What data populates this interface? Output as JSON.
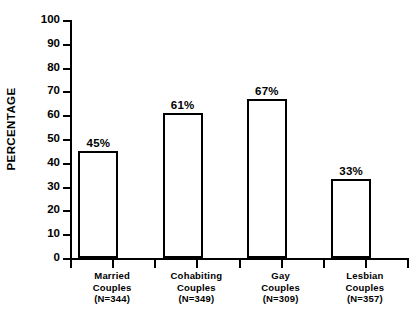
{
  "chart_data": {
    "type": "bar",
    "title": "",
    "subtitle": "",
    "xlabel": "",
    "ylabel": "PERCENTAGE",
    "ylim": [
      0,
      100
    ],
    "yticks": [
      0,
      10,
      20,
      30,
      40,
      50,
      60,
      70,
      80,
      90,
      100
    ],
    "ytick_labels": [
      "0",
      "10",
      "20",
      "30",
      "40",
      "50",
      "60",
      "70",
      "80",
      "90",
      "100"
    ],
    "grid": false,
    "legend": null,
    "orientation": "vertical",
    "bar_style": {
      "fill": "#ffffff",
      "edge": "#000000",
      "edge_width_px": 2
    },
    "categories": [
      "Married Couples (N=344)",
      "Cohabiting Couples (N=349)",
      "Gay Couples (N=309)",
      "Lesbian Couples (N=357)"
    ],
    "values": [
      45,
      61,
      67,
      33
    ],
    "data_labels": [
      "45%",
      "61%",
      "67%",
      "33%"
    ]
  },
  "axis": {
    "y_title": "PERCENTAGE",
    "y_ticks": [
      {
        "label": "100",
        "value": 100
      },
      {
        "label": "90",
        "value": 90
      },
      {
        "label": "80",
        "value": 80
      },
      {
        "label": "70",
        "value": 70
      },
      {
        "label": "60",
        "value": 60
      },
      {
        "label": "50",
        "value": 50
      },
      {
        "label": "40",
        "value": 40
      },
      {
        "label": "30",
        "value": 30
      },
      {
        "label": "20",
        "value": 20
      },
      {
        "label": "10",
        "value": 10
      },
      {
        "label": "0",
        "value": 0
      }
    ]
  },
  "bars": [
    {
      "group": "Married",
      "line1": "Married",
      "line2": "Couples",
      "line3": "(N=344)",
      "value": 45,
      "value_label": "45%",
      "n": 344
    },
    {
      "group": "Cohabiting",
      "line1": "Cohabiting",
      "line2": "Couples",
      "line3": "(N=349)",
      "value": 61,
      "value_label": "61%",
      "n": 349
    },
    {
      "group": "Gay",
      "line1": "Gay",
      "line2": "Couples",
      "line3": "(N=309)",
      "value": 67,
      "value_label": "67%",
      "n": 309
    },
    {
      "group": "Lesbian",
      "line1": "Lesbian",
      "line2": "Couples",
      "line3": "(N=357)",
      "value": 33,
      "value_label": "33%",
      "n": 357
    }
  ],
  "colors": {
    "ink": "#000000",
    "background": "#ffffff",
    "bar_fill": "#ffffff"
  }
}
